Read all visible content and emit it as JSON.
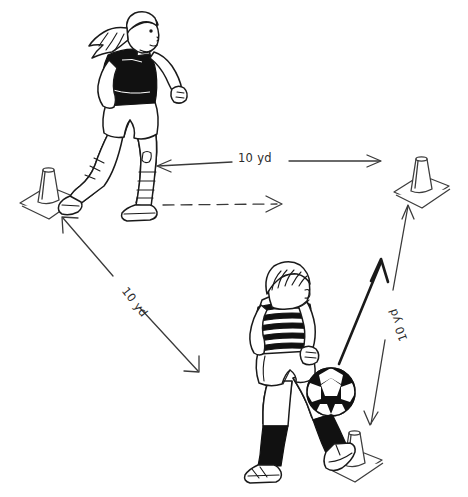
{
  "diagram": {
    "background_color": "#ffffff",
    "ink_color": "#1a1a1a",
    "line_color": "#3a3a3a",
    "labels": {
      "top_distance": "10 yd",
      "left_distance": "10 yd",
      "right_distance": "10 yd"
    },
    "cones": [
      {
        "name": "cone-left",
        "position": "left",
        "x": 44,
        "y": 185
      },
      {
        "name": "cone-right",
        "position": "top-right",
        "x": 421,
        "y": 175
      },
      {
        "name": "cone-bottom",
        "position": "bottom-right",
        "x": 354,
        "y": 450
      }
    ],
    "players": [
      {
        "name": "player-girl",
        "description": "Girl running toward the left cone",
        "shirt": "black",
        "shorts": "white",
        "socks": "white striped",
        "hair": "ponytail with headband",
        "x": 128,
        "y": 120
      },
      {
        "name": "player-boy",
        "description": "Boy dribbling a soccer ball",
        "shirt": "striped",
        "shorts": "white",
        "socks": "black",
        "hair": "short",
        "x": 295,
        "y": 375
      }
    ],
    "ball": {
      "name": "soccer-ball",
      "x": 331,
      "y": 392,
      "radius": 24
    },
    "arrows": [
      {
        "name": "measure-arrow-top",
        "style": "double-headed thin",
        "label": "10 yd"
      },
      {
        "name": "measure-arrow-left",
        "style": "double-headed thin",
        "label": "10 yd"
      },
      {
        "name": "measure-arrow-right",
        "style": "single-headed thin",
        "label": "10 yd"
      },
      {
        "name": "path-arrow-dashed",
        "style": "dashed single-headed",
        "label": ""
      },
      {
        "name": "path-arrow-solid-bold",
        "style": "solid bold single-headed",
        "label": ""
      }
    ]
  }
}
